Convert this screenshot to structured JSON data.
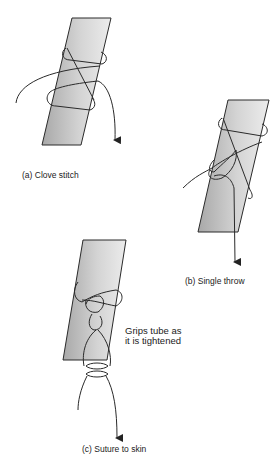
{
  "panels": [
    {
      "id": "a",
      "caption": "(a)  Clove stitch"
    },
    {
      "id": "b",
      "caption": "(b)  Single throw"
    },
    {
      "id": "c",
      "caption": "(c)  Suture to skin",
      "annotation_line1": "Grips tube as",
      "annotation_line2": "it is tightened"
    }
  ],
  "colors": {
    "tube_light": "#e6e6e6",
    "tube_dark": "#a9a9a9",
    "line": "#2a2a2a",
    "background": "#ffffff"
  }
}
